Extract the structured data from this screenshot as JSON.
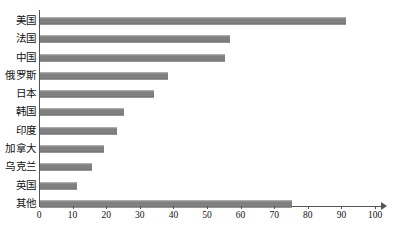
{
  "chart_data": {
    "type": "bar",
    "orientation": "horizontal",
    "title": "",
    "xlabel": "",
    "ylabel": "",
    "categories": [
      "美国",
      "法国",
      "中国",
      "俄罗斯",
      "日本",
      "韩国",
      "印度",
      "加拿大",
      "乌克兰",
      "英国",
      "其他"
    ],
    "values": [
      91,
      56.5,
      55,
      38,
      34,
      25,
      23,
      19,
      15.5,
      11,
      75
    ],
    "xlim": [
      0,
      100
    ],
    "xticks": [
      0,
      10,
      20,
      30,
      40,
      50,
      60,
      70,
      80,
      90,
      100
    ],
    "xtick_labels": [
      "0",
      "10",
      "20",
      "30",
      "40",
      "50",
      "60",
      "70",
      "80",
      "90",
      "100"
    ],
    "grid": false,
    "legend": null,
    "bar_color": "#808080",
    "axis_color": "#555555"
  }
}
